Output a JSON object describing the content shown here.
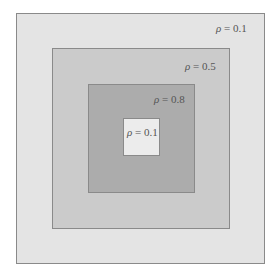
{
  "diagram": {
    "type": "nested-squares",
    "regions": [
      {
        "id": "outer",
        "rho_symbol": "ρ",
        "equals": " = ",
        "value": "0.1",
        "fill": "#e4e4e4"
      },
      {
        "id": "mid",
        "rho_symbol": "ρ",
        "equals": " = ",
        "value": "0.5",
        "fill": "#cbcbcb"
      },
      {
        "id": "inner",
        "rho_symbol": "ρ",
        "equals": " = ",
        "value": "0.8",
        "fill": "#acacac"
      },
      {
        "id": "core",
        "rho_symbol": "ρ",
        "equals": " = ",
        "value": "0.1",
        "fill": "#ececec"
      }
    ],
    "border_color": "#8a8a8a"
  }
}
